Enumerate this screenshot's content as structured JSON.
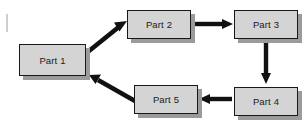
{
  "diagram": {
    "type": "flowchart",
    "canvas": {
      "width": 307,
      "height": 124,
      "background": "#ffffff"
    },
    "style": {
      "node_fill": "#d4d4d4",
      "node_border": "#15181c",
      "node_shadow": "#9b9b9b",
      "arrow_color": "#111111",
      "text_color": "#1a1a1a"
    },
    "nodes": [
      {
        "id": "part1",
        "label": "Part 1",
        "x": 19,
        "y": 44,
        "w": 67,
        "h": 32
      },
      {
        "id": "part2",
        "label": "Part 2",
        "x": 127,
        "y": 10,
        "w": 64,
        "h": 29
      },
      {
        "id": "part3",
        "label": "Part 3",
        "x": 234,
        "y": 10,
        "w": 64,
        "h": 29
      },
      {
        "id": "part4",
        "label": "Part 4",
        "x": 234,
        "y": 87,
        "w": 64,
        "h": 29
      },
      {
        "id": "part5",
        "label": "Part 5",
        "x": 134,
        "y": 85,
        "w": 64,
        "h": 29
      }
    ],
    "edges": [
      {
        "id": "part1-to-part2",
        "from": "part1",
        "to": "part2",
        "direction": "up-right",
        "shape": "diagonal"
      },
      {
        "id": "part2-to-part3",
        "from": "part2",
        "to": "part3",
        "direction": "right",
        "shape": "horizontal"
      },
      {
        "id": "part3-to-part4",
        "from": "part3",
        "to": "part4",
        "direction": "down",
        "shape": "vertical"
      },
      {
        "id": "part4-to-part5",
        "from": "part4",
        "to": "part5",
        "direction": "left",
        "shape": "horizontal"
      },
      {
        "id": "part5-to-part1",
        "from": "part5",
        "to": "part1",
        "direction": "up-left",
        "shape": "diagonal"
      }
    ]
  }
}
